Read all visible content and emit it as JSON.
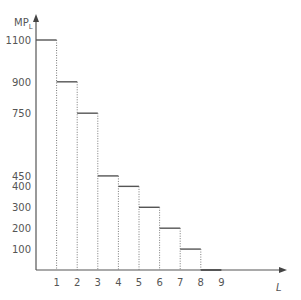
{
  "chart_data": {
    "type": "bar",
    "subtype": "step",
    "title": "",
    "xlabel": "L",
    "ylabel": "MP",
    "ylabel_subscript": "L",
    "categories": [
      "0-1",
      "1-2",
      "2-3",
      "3-4",
      "4-5",
      "5-6",
      "6-7",
      "7-8",
      "8-9"
    ],
    "x_ticks": [
      1,
      2,
      3,
      4,
      5,
      6,
      7,
      8,
      9
    ],
    "y_ticks": [
      100,
      200,
      300,
      400,
      450,
      750,
      900,
      1100
    ],
    "values": [
      1100,
      900,
      750,
      450,
      400,
      300,
      200,
      100,
      0
    ],
    "xlim": [
      0,
      10.5
    ],
    "ylim": [
      0,
      1150
    ],
    "grid": false,
    "legend": null,
    "colors": {
      "axis": "#555555",
      "step": "#555555",
      "dotted": "#777777"
    }
  }
}
